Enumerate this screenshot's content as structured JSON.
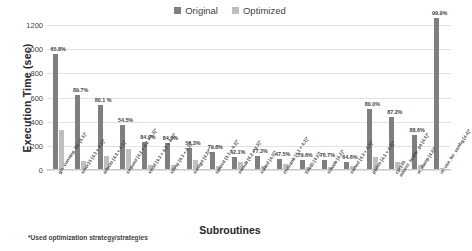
{
  "chart_data": {
    "type": "bar",
    "title": "",
    "xlabel": "Subroutines",
    "ylabel": "Execution Time (sec)",
    "ylim": [
      0,
      1200
    ],
    "yticks": [
      0,
      200,
      400,
      600,
      800,
      1000,
      1200
    ],
    "grid": true,
    "legend_position": "top-center",
    "footnote": "*Used optimization strategy/strategies",
    "categories": [
      "gls_constep_tile [4.1]*",
      "smvr15 [4.1 + 4.2]*",
      "adocts [4.1 + 4.2]*",
      "swpued [4.1 + 4.2 + 4.3]*",
      "strud [4.1 + 4.2 + 4.3]*",
      "stlssy [4.1 + 4.2]*",
      "suntgrt [4.2]*",
      "sprocd [4.1 + 4.2]*",
      "swoub [4.2 + 4.3]*",
      "sulard [4.2]*",
      "mulcaob [4.1 + 4.2]*",
      "filictD [4.2]*",
      "sinuob [4.2]*",
      "swned [4.2 + 4.3]*",
      "pbilim [4.1 + 4.2]*",
      "cpry16 / advect_scalar_p4 [4.1]*",
      "w_damp [4.2]*",
      "in_use_for_config [4.4]*"
    ],
    "series": [
      {
        "name": "Original",
        "color": "#7f7f7f",
        "values": [
          950,
          612,
          533,
          362,
          225,
          214,
          171,
          144,
          96,
          110,
          79,
          78,
          72,
          59,
          495,
          432,
          284,
          1253
        ]
      },
      {
        "name": "Optimized",
        "color": "#bfbfbf",
        "values": [
          325,
          63,
          106,
          165,
          34,
          34,
          75,
          29,
          56,
          25,
          42,
          16,
          17,
          21,
          99,
          55,
          32,
          1
        ]
      }
    ],
    "data_labels": [
      "65.8%",
      "89.7%",
      "80.1 %",
      "54.5%",
      "84.9%",
      "84.0%",
      "56.3%",
      "79.8%",
      "42.1%",
      "77.3%",
      "47.5%",
      "79.6%",
      "76.7%",
      "64.6%",
      "80.0%",
      "87.2%",
      "88.6%",
      "99.9%"
    ]
  },
  "legend": {
    "items": [
      {
        "label": "Original",
        "color": "#7f7f7f"
      },
      {
        "label": "Optimized",
        "color": "#bfbfbf"
      }
    ]
  }
}
